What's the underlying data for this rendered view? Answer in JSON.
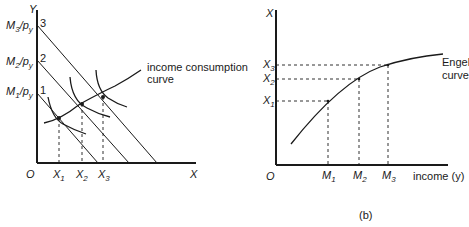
{
  "panel_a": {
    "y_axis_label": "Y",
    "x_axis_label": "X",
    "origin_label": "O",
    "y_ticks": [
      {
        "main": "M",
        "sub": "3",
        "suffix": "/p",
        "suffix_sub": "y",
        "index": "3"
      },
      {
        "main": "M",
        "sub": "2",
        "suffix": "/p",
        "suffix_sub": "y",
        "index": "2"
      },
      {
        "main": "M",
        "sub": "1",
        "suffix": "/p",
        "suffix_sub": "y",
        "index": "1"
      }
    ],
    "x_ticks": [
      {
        "main": "X",
        "sub": "1"
      },
      {
        "main": "X",
        "sub": "2"
      },
      {
        "main": "X",
        "sub": "3"
      }
    ],
    "curve_label_line1": "income consumption",
    "curve_label_line2": "curve"
  },
  "panel_b": {
    "y_axis_label": "X",
    "x_axis_label": "income (y)",
    "origin_label": "O",
    "y_ticks": [
      {
        "main": "X",
        "sub": "3"
      },
      {
        "main": "X",
        "sub": "2"
      },
      {
        "main": "X",
        "sub": "1"
      }
    ],
    "x_ticks": [
      {
        "main": "M",
        "sub": "1"
      },
      {
        "main": "M",
        "sub": "2"
      },
      {
        "main": "M",
        "sub": "3"
      }
    ],
    "curve_label_line1": "Engel",
    "curve_label_line2": "curve",
    "caption": "(b)"
  }
}
